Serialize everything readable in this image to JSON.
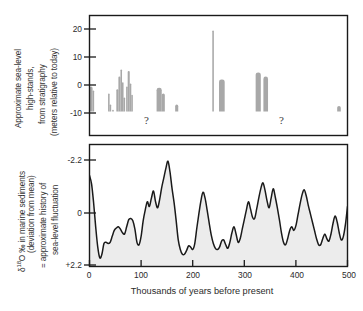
{
  "figure": {
    "width": 363,
    "height": 311,
    "background": "#ffffff",
    "line_color": "#1a1a1a",
    "bar_fill": "#a8a8a8",
    "area_fill": "#ececec"
  },
  "top_panel": {
    "ylabel_lines": [
      "Approximate sea-level",
      "high-stands,",
      "from stratigraphy",
      "(meters relative to today)"
    ],
    "yticks": [
      "20",
      "10",
      "0",
      "-10"
    ],
    "annotations": [
      {
        "text": "?",
        "x": 115,
        "y": -13.5
      },
      {
        "text": "?",
        "x": 375,
        "y": -13.5
      }
    ]
  },
  "bottom_panel": {
    "ylabel_lines": [
      "δ¹⁸O ‰ in marine sediments",
      "(deviation from mean)",
      "= approximate history of",
      "sea-level fluctuation"
    ],
    "ylabel_parts": {
      "delta": "δ",
      "iso": "18",
      "rest": "O ‰ in marine sediments",
      "line2": "(deviation from mean)",
      "line3": "= approximate history of",
      "line4": "sea-level fluctuation"
    },
    "yticks": [
      "-2.2",
      "0",
      "+2.2"
    ]
  },
  "xaxis": {
    "title": "Thousands of years before present",
    "ticks": [
      "0",
      "100",
      "200",
      "300",
      "400",
      "500"
    ]
  },
  "chart_data": [
    {
      "type": "bar",
      "panel": "top",
      "title": "Approximate sea-level high-stands, from stratigraphy",
      "xlabel": "Thousands of years before present",
      "ylabel": "meters relative to today",
      "xlim": [
        0,
        500
      ],
      "ylim": [
        -11,
        24
      ],
      "grid": false,
      "yticks": [
        20,
        10,
        0,
        -10
      ],
      "baseline": -9.5,
      "note": "Vertical gray bars = dated sea-level high-stand deposits. Each bar: x0/x1 in ka before present, top = meters relative to today, bottom = baseline.",
      "bars": [
        {
          "x0": 0,
          "x1": 6,
          "top": -0.5
        },
        {
          "x0": 6,
          "x1": 9,
          "top": -2.0
        },
        {
          "x0": 36,
          "x1": 39,
          "top": -3.0
        },
        {
          "x0": 39,
          "x1": 42,
          "top": -7.0
        },
        {
          "x0": 44,
          "x1": 47,
          "top": -8.8
        },
        {
          "x0": 52,
          "x1": 56,
          "top": -1.5
        },
        {
          "x0": 56,
          "x1": 60,
          "top": 3.0
        },
        {
          "x0": 60,
          "x1": 63,
          "top": 5.5
        },
        {
          "x0": 63,
          "x1": 66,
          "top": 1.0
        },
        {
          "x0": 66,
          "x1": 69,
          "top": -4.5
        },
        {
          "x0": 71,
          "x1": 74,
          "top": -0.5
        },
        {
          "x0": 74,
          "x1": 78,
          "top": 5.0
        },
        {
          "x0": 78,
          "x1": 81,
          "top": 0.5
        },
        {
          "x0": 81,
          "x1": 84,
          "top": -3.5
        },
        {
          "x0": 130,
          "x1": 140,
          "top": -1.0
        },
        {
          "x0": 140,
          "x1": 146,
          "top": -3.0
        },
        {
          "x0": 166,
          "x1": 172,
          "top": -7.0
        },
        {
          "x0": 238,
          "x1": 241,
          "top": 19.5
        },
        {
          "x0": 251,
          "x1": 262,
          "top": 2.0
        },
        {
          "x0": 322,
          "x1": 332,
          "top": 4.5
        },
        {
          "x0": 337,
          "x1": 346,
          "top": 3.0
        },
        {
          "x0": 480,
          "x1": 487,
          "top": -7.5
        }
      ]
    },
    {
      "type": "area",
      "panel": "bottom",
      "title": "δ18O ‰ in marine sediments (deviation from mean) = approximate history of sea-level fluctuation",
      "xlabel": "Thousands of years before present",
      "ylabel": "δ18O ‰ (deviation from mean)",
      "xlim": [
        0,
        500
      ],
      "ylim": [
        -2.2,
        2.2
      ],
      "y_axis_inverted": true,
      "yticks": [
        -2.2,
        0,
        2.2
      ],
      "ytick_labels": [
        "-2.2",
        "0",
        "+2.2"
      ],
      "grid": false,
      "x": [
        0,
        4,
        8,
        12,
        16,
        20,
        24,
        28,
        32,
        36,
        40,
        44,
        48,
        52,
        56,
        60,
        64,
        68,
        72,
        76,
        80,
        84,
        88,
        92,
        96,
        100,
        104,
        108,
        112,
        116,
        120,
        124,
        128,
        132,
        136,
        140,
        144,
        148,
        152,
        156,
        160,
        164,
        168,
        172,
        176,
        180,
        184,
        188,
        192,
        196,
        200,
        204,
        208,
        212,
        216,
        220,
        224,
        228,
        232,
        236,
        240,
        244,
        248,
        252,
        256,
        260,
        264,
        268,
        272,
        276,
        280,
        284,
        288,
        292,
        296,
        300,
        304,
        308,
        312,
        316,
        320,
        324,
        328,
        332,
        336,
        340,
        344,
        348,
        352,
        356,
        360,
        364,
        368,
        372,
        376,
        380,
        384,
        388,
        392,
        396,
        400,
        404,
        408,
        412,
        416,
        420,
        424,
        428,
        432,
        436,
        440,
        444,
        448,
        452,
        456,
        460,
        464,
        468,
        472,
        476,
        480,
        484,
        488,
        492,
        496,
        500
      ],
      "y": [
        -1.55,
        -1.2,
        -0.4,
        0.6,
        1.45,
        1.9,
        1.75,
        1.3,
        1.25,
        1.3,
        1.25,
        1.0,
        0.75,
        0.65,
        0.6,
        0.7,
        0.85,
        0.9,
        0.6,
        0.3,
        0.25,
        0.35,
        0.7,
        1.25,
        1.35,
        1.0,
        0.35,
        -0.1,
        -0.45,
        -0.25,
        -0.6,
        -0.9,
        -0.45,
        -0.2,
        -0.55,
        -1.05,
        -1.45,
        -1.85,
        -2.15,
        -1.7,
        -1.0,
        -0.4,
        0.35,
        1.15,
        1.55,
        1.75,
        1.75,
        1.6,
        1.4,
        1.45,
        1.55,
        1.3,
        0.65,
        0.05,
        -0.5,
        -0.85,
        -0.6,
        -0.1,
        0.45,
        0.95,
        1.3,
        1.5,
        1.55,
        1.45,
        1.2,
        1.15,
        1.35,
        1.5,
        1.25,
        0.85,
        0.6,
        0.9,
        1.25,
        1.1,
        0.7,
        0.3,
        -0.1,
        -0.45,
        -0.15,
        0.2,
        0.25,
        -0.15,
        -0.6,
        -1.0,
        -1.25,
        -0.95,
        -0.5,
        -0.2,
        -0.6,
        -1.0,
        -0.65,
        -0.2,
        0.3,
        0.85,
        1.25,
        1.35,
        1.1,
        0.75,
        0.6,
        0.75,
        0.55,
        0.1,
        -0.35,
        -0.75,
        -0.95,
        -0.7,
        -0.3,
        0.05,
        0.4,
        0.75,
        1.1,
        1.35,
        1.35,
        1.1,
        0.9,
        1.1,
        1.2,
        0.9,
        0.45,
        0.15,
        0.4,
        0.85,
        1.15,
        1.0,
        0.5,
        -0.25,
        -0.6,
        -0.65,
        -0.6,
        -0.6,
        -0.6
      ]
    }
  ]
}
